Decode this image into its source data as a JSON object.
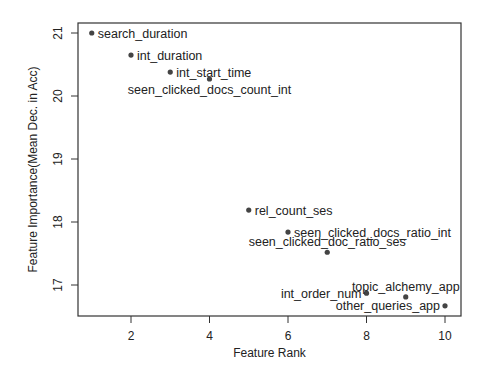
{
  "chart_data": {
    "type": "scatter",
    "title": "",
    "xlabel": "Feature Rank",
    "ylabel": "Feature Importance(Mean Dec. in Acc)",
    "xlim": [
      0.6,
      10.4
    ],
    "ylim": [
      16.5,
      21.2
    ],
    "xticks": [
      2,
      4,
      6,
      8,
      10
    ],
    "yticks": [
      17,
      18,
      19,
      20,
      21
    ],
    "grid": false,
    "legend": null,
    "points": [
      {
        "x": 1,
        "y": 21.0,
        "label": "search_duration",
        "label_pos": "right"
      },
      {
        "x": 2,
        "y": 20.65,
        "label": "int_duration",
        "label_pos": "right"
      },
      {
        "x": 3,
        "y": 20.38,
        "label": "int_start_time",
        "label_pos": "right"
      },
      {
        "x": 4,
        "y": 20.27,
        "label": "seen_clicked_docs_count_int",
        "label_pos": "below"
      },
      {
        "x": 5,
        "y": 18.19,
        "label": "rel_count_ses",
        "label_pos": "right"
      },
      {
        "x": 6,
        "y": 17.84,
        "label": "seen_clicked_docs_ratio_int",
        "label_pos": "right"
      },
      {
        "x": 7,
        "y": 17.52,
        "label": "seen_clicked_doc_ratio_ses",
        "label_pos": "above"
      },
      {
        "x": 8,
        "y": 16.87,
        "label": "int_order_num",
        "label_pos": "left"
      },
      {
        "x": 9,
        "y": 16.81,
        "label": "topic_alchemy_app",
        "label_pos": "above"
      },
      {
        "x": 10,
        "y": 16.67,
        "label": "other_queries_app",
        "label_pos": "left"
      }
    ]
  },
  "layout": {
    "plot_left": 78,
    "plot_right": 461,
    "plot_top": 23,
    "plot_bottom": 316,
    "x_px_at_2": 131,
    "x_px_at_10": 445,
    "y_px_at_21": 33,
    "y_px_at_17": 285
  }
}
